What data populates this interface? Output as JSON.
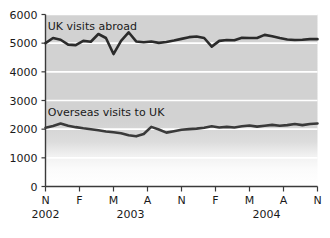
{
  "chart_data": {
    "type": "line",
    "title": "",
    "xlabel": "",
    "ylabel": "",
    "ylim": [
      0,
      6000
    ],
    "grid": true,
    "legend_position": "inline-annotation",
    "y_ticks": [
      0,
      1000,
      2000,
      3000,
      4000,
      5000,
      6000
    ],
    "y_tick_labels": [
      "0",
      "1000",
      "2000",
      "3000",
      "4000",
      "5000",
      "6000"
    ],
    "x_ticks": [
      "N",
      "F",
      "M",
      "A",
      "N",
      "F",
      "M",
      "A",
      "N"
    ],
    "x_group_labels": [
      "2002",
      "2003",
      "2004"
    ],
    "x_group_positions": [
      0,
      2.5,
      6.5
    ],
    "annotations": [
      {
        "text": "UK visits abroad",
        "x": 0.3,
        "y": 5600
      },
      {
        "text": "Overseas visits to UK",
        "x": 0.3,
        "y": 2600
      }
    ],
    "series": [
      {
        "name": "UK visits abroad",
        "color": "#2b2b2b",
        "values": [
          5000,
          5180,
          5120,
          4950,
          4930,
          5080,
          5050,
          5320,
          5180,
          4620,
          5080,
          5380,
          5060,
          5030,
          5060,
          5010,
          5040,
          5090,
          5150,
          5210,
          5230,
          5180,
          4880,
          5080,
          5110,
          5100,
          5190,
          5180,
          5180,
          5290,
          5240,
          5180,
          5130,
          5110,
          5120,
          5140,
          5140
        ]
      },
      {
        "name": "Overseas visits to UK",
        "color": "#3a3a3a",
        "values": [
          2050,
          2110,
          2200,
          2120,
          2070,
          2030,
          2000,
          1960,
          1920,
          1890,
          1860,
          1790,
          1750,
          1830,
          2080,
          1990,
          1880,
          1930,
          1980,
          2000,
          2020,
          2050,
          2100,
          2060,
          2080,
          2060,
          2100,
          2130,
          2090,
          2120,
          2150,
          2120,
          2140,
          2180,
          2140,
          2180,
          2200
        ]
      }
    ]
  },
  "axis": {
    "y_axis_name": "y-axis",
    "x_axis_name": "x-axis"
  }
}
